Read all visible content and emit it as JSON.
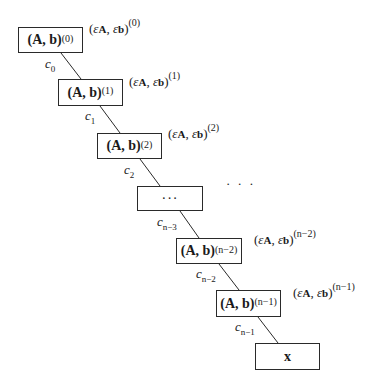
{
  "diagram": {
    "type": "chain",
    "nodes": [
      {
        "id": "n0",
        "base": "(A, b)",
        "sup": "(0)",
        "x": 18,
        "y": 27,
        "w": 65,
        "h": 26
      },
      {
        "id": "n1",
        "base": "(A, b)",
        "sup": "(1)",
        "x": 58,
        "y": 79,
        "w": 65,
        "h": 27
      },
      {
        "id": "n2",
        "base": "(A, b)",
        "sup": "(2)",
        "x": 97,
        "y": 133,
        "w": 65,
        "h": 26
      },
      {
        "id": "n3",
        "base": "",
        "sup": "",
        "ellipsis": "···",
        "x": 137,
        "y": 186,
        "w": 66,
        "h": 25
      },
      {
        "id": "n4",
        "base": "(A, b)",
        "sup": "(n−2)",
        "x": 176,
        "y": 238,
        "w": 66,
        "h": 26
      },
      {
        "id": "n5",
        "base": "(A, b)",
        "sup": "(n−1)",
        "x": 216,
        "y": 290,
        "w": 65,
        "h": 27
      },
      {
        "id": "n6",
        "base": "x",
        "sup": "",
        "x": 255,
        "y": 343,
        "w": 65,
        "h": 27
      }
    ],
    "edges": [
      {
        "from": "n0",
        "to": "n1",
        "label": "c",
        "sub": "0"
      },
      {
        "from": "n1",
        "to": "n2",
        "label": "c",
        "sub": "1"
      },
      {
        "from": "n2",
        "to": "n3",
        "label": "c",
        "sub": "2"
      },
      {
        "from": "n3",
        "to": "n4",
        "label": "c",
        "sub": "n−3"
      },
      {
        "from": "n4",
        "to": "n5",
        "label": "c",
        "sub": "n−2"
      },
      {
        "from": "n5",
        "to": "n6",
        "label": "c",
        "sub": "n−1"
      }
    ],
    "annotations": [
      {
        "text_open": "(",
        "eps1": "ε",
        "sub1": "A",
        "sep": ", ",
        "eps2": "ε",
        "sub2": "b",
        "text_close": ")",
        "sup": "(0)"
      },
      {
        "text_open": "(",
        "eps1": "ε",
        "sub1": "A",
        "sep": ", ",
        "eps2": "ε",
        "sub2": "b",
        "text_close": ")",
        "sup": "(1)"
      },
      {
        "text_open": "(",
        "eps1": "ε",
        "sub1": "A",
        "sep": ", ",
        "eps2": "ε",
        "sub2": "b",
        "text_close": ")",
        "sup": "(2)"
      },
      {
        "text_open": "(",
        "eps1": "ε",
        "sub1": "A",
        "sep": ", ",
        "eps2": "ε",
        "sub2": "b",
        "text_close": ")",
        "sup": "(n−2)"
      },
      {
        "text_open": "(",
        "eps1": "ε",
        "sub1": "A",
        "sep": ", ",
        "eps2": "ε",
        "sub2": "b",
        "text_close": ")",
        "sup": "(n−1)"
      }
    ],
    "free_ellipsis": "· · ·"
  }
}
